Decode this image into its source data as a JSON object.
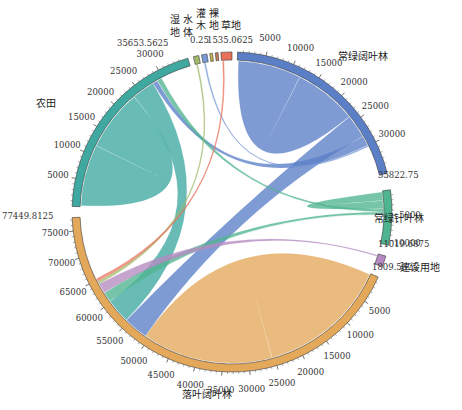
{
  "chart_data": {
    "type": "chord",
    "title": "",
    "center": [
      232,
      212
    ],
    "radius": 160,
    "segments": [
      {
        "name": "常绿阔叶林",
        "total": 35822.75,
        "color": "#5b7fc7",
        "start_deg": -88,
        "end_deg": -14,
        "ticks": [
          5000,
          10000,
          15000,
          20000,
          25000,
          30000
        ],
        "end_label": "35822.75",
        "label_pos": [
          340,
          60
        ]
      },
      {
        "name": "常绿针叶林",
        "total": 11019.6875,
        "color": "#4fb590",
        "start_deg": -8,
        "end_deg": 12,
        "ticks": [
          5000,
          10000
        ],
        "end_label": "11019.6875",
        "label_pos": [
          372,
          220
        ]
      },
      {
        "name": "建设用地",
        "total": 1809.5625,
        "color": "#b58ac0",
        "start_deg": 16,
        "end_deg": 20,
        "ticks": [],
        "end_label": "1809.5625",
        "label_pos": [
          385,
          266
        ]
      },
      {
        "name": "落叶阔叶林",
        "total": 77449.8125,
        "color": "#e3a85a",
        "start_deg": 24,
        "end_deg": 178,
        "ticks": [
          5000,
          10000,
          15000,
          20000,
          25000,
          30000,
          35000,
          40000,
          45000,
          50000,
          55000,
          60000,
          65000,
          70000,
          75000
        ],
        "end_label": "77449.8125",
        "label_pos": [
          185,
          397
        ]
      },
      {
        "name": "农田",
        "total": 35653.5625,
        "color": "#3fa8a0",
        "start_deg": 182,
        "end_deg": 254,
        "ticks": [
          5000,
          10000,
          15000,
          20000,
          25000,
          30000
        ],
        "end_label": "35653.5625",
        "label_pos": [
          38,
          106
        ]
      },
      {
        "name": "湿地",
        "total": null,
        "color": "#9fb86a",
        "start_deg": 256,
        "end_deg": 258,
        "ticks": [],
        "end_label": "",
        "label_pos": [
          172,
          22
        ]
      },
      {
        "name": "水体",
        "total": null,
        "color": "#7a9ad6",
        "start_deg": 259,
        "end_deg": 261,
        "ticks": [],
        "end_label": "",
        "label_pos": [
          186,
          22
        ]
      },
      {
        "name": "灌木",
        "total": 0.25,
        "color": "#c6b34e",
        "start_deg": 262,
        "end_deg": 263,
        "ticks": [],
        "end_label": "0.25",
        "label_pos": [
          200,
          18
        ]
      },
      {
        "name": "裸地",
        "total": null,
        "color": "#c07a5a",
        "start_deg": 264,
        "end_deg": 265,
        "ticks": [],
        "end_label": "",
        "label_pos": [
          214,
          18
        ]
      },
      {
        "name": "草地",
        "total": 1535.0625,
        "color": "#e8715a",
        "start_deg": 266,
        "end_deg": 270,
        "ticks": [],
        "end_label": "1535.0625",
        "label_pos": [
          228,
          22
        ]
      }
    ],
    "chords": [
      {
        "from": "落叶阔叶林",
        "to": "落叶阔叶林",
        "weight": "large"
      },
      {
        "from": "常绿阔叶林",
        "to": "常绿阔叶林",
        "weight": "large"
      },
      {
        "from": "农田",
        "to": "农田",
        "weight": "large"
      },
      {
        "from": "常绿针叶林",
        "to": "常绿针叶林",
        "weight": "medium"
      },
      {
        "from": "常绿阔叶林",
        "to": "落叶阔叶林",
        "weight": "medium"
      },
      {
        "from": "农田",
        "to": "落叶阔叶林",
        "weight": "medium"
      },
      {
        "from": "常绿阔叶林",
        "to": "农田",
        "weight": "small"
      },
      {
        "from": "常绿针叶林",
        "to": "农田",
        "weight": "small"
      },
      {
        "from": "常绿针叶林",
        "to": "落叶阔叶林",
        "weight": "small"
      },
      {
        "from": "建设用地",
        "to": "落叶阔叶林",
        "weight": "small"
      },
      {
        "from": "湿地",
        "to": "落叶阔叶林",
        "weight": "thin"
      },
      {
        "from": "水体",
        "to": "常绿阔叶林",
        "weight": "thin"
      },
      {
        "from": "草地",
        "to": "落叶阔叶林",
        "weight": "thin"
      }
    ],
    "legend": "none"
  },
  "labels": {
    "evergreen_broadleaf": "常绿阔叶林",
    "evergreen_needle": "常绿针叶林",
    "construction": "建设用地",
    "deciduous_broadleaf": "落叶阔叶林",
    "farmland": "农田",
    "wetland_1": "湿",
    "wetland_2": "地",
    "water_1": "水",
    "water_2": "体",
    "shrub_1": "灌",
    "shrub_2": "木",
    "bare_1": "裸",
    "bare_2": "地",
    "grass": "草地",
    "v_shrub": "0.25",
    "v_grass": "1535.0625",
    "v_farm": "35653.5625",
    "v_ebf": "35822.75",
    "v_enf": "11019.6875",
    "v_con": "1809.5625",
    "v_dbf": "77449.8125"
  }
}
